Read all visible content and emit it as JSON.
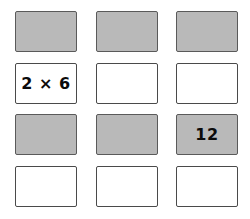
{
  "grid": {
    "columns": 3,
    "rows": 4,
    "background_color": "#ffffff",
    "filled_color": "#b9b9b9",
    "empty_color": "#ffffff",
    "border_color": "#4a4a4a",
    "text_color": "#0b0b0b",
    "cards": [
      {
        "row": 0,
        "col": 0,
        "filled": true,
        "label": ""
      },
      {
        "row": 0,
        "col": 1,
        "filled": true,
        "label": ""
      },
      {
        "row": 0,
        "col": 2,
        "filled": true,
        "label": ""
      },
      {
        "row": 1,
        "col": 0,
        "filled": false,
        "label": "2 × 6"
      },
      {
        "row": 1,
        "col": 1,
        "filled": false,
        "label": ""
      },
      {
        "row": 1,
        "col": 2,
        "filled": false,
        "label": ""
      },
      {
        "row": 2,
        "col": 0,
        "filled": true,
        "label": ""
      },
      {
        "row": 2,
        "col": 1,
        "filled": true,
        "label": ""
      },
      {
        "row": 2,
        "col": 2,
        "filled": true,
        "label": "12"
      },
      {
        "row": 3,
        "col": 0,
        "filled": false,
        "label": ""
      },
      {
        "row": 3,
        "col": 1,
        "filled": false,
        "label": ""
      },
      {
        "row": 3,
        "col": 2,
        "filled": false,
        "label": ""
      }
    ]
  }
}
